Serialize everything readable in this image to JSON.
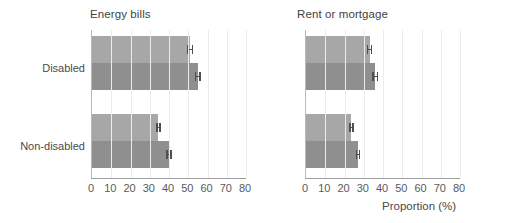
{
  "chart_data": {
    "type": "bar",
    "orientation": "horizontal",
    "title": "",
    "xlabel": "Proportion (%)",
    "ylabel": "",
    "xlim": [
      0,
      80
    ],
    "xticks": [
      0,
      10,
      20,
      30,
      40,
      50,
      60,
      70,
      80
    ],
    "grid": true,
    "legend": "none",
    "categories": [
      "Disabled",
      "Non-disabled"
    ],
    "series_colors": {
      "light": "#a7a7a7",
      "dark": "#8f8f8f"
    },
    "panels": [
      {
        "title": "Energy bills",
        "series": [
          {
            "name": "light",
            "color": "#a7a7a7",
            "values": [
              51.0,
              34.5
            ],
            "err_low": [
              49.5,
              33.3
            ],
            "err_high": [
              52.5,
              35.8
            ]
          },
          {
            "name": "dark",
            "color": "#8f8f8f",
            "values": [
              55.0,
              40.0
            ],
            "err_low": [
              53.5,
              38.7
            ],
            "err_high": [
              56.6,
              41.4
            ]
          }
        ]
      },
      {
        "title": "Rent or mortgage",
        "series": [
          {
            "name": "light",
            "color": "#a7a7a7",
            "values": [
              33.0,
              23.5
            ],
            "err_low": [
              31.6,
              22.4
            ],
            "err_high": [
              34.5,
              24.7
            ]
          },
          {
            "name": "dark",
            "color": "#8f8f8f",
            "values": [
              36.0,
              27.0
            ],
            "err_low": [
              34.4,
              25.8
            ],
            "err_high": [
              37.6,
              28.3
            ]
          }
        ]
      }
    ]
  },
  "panels": {
    "energy": {
      "title": "Energy bills",
      "ytick_labels": [
        "Disabled",
        "Non-disabled"
      ],
      "xtick_labels": [
        "0",
        "10",
        "20",
        "30",
        "40",
        "50",
        "60",
        "70",
        "80"
      ]
    },
    "rent": {
      "title": "Rent or mortgage",
      "xtick_labels": [
        "0",
        "10",
        "20",
        "30",
        "40",
        "50",
        "60",
        "70",
        "80"
      ],
      "axis_title": "Proportion (%)"
    }
  }
}
